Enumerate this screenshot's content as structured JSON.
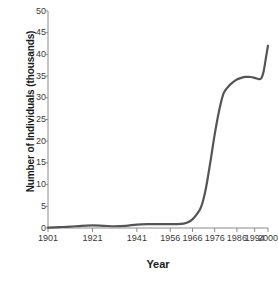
{
  "chart_data": {
    "type": "line",
    "title": "",
    "xlabel": "Year",
    "ylabel": "Number of Individuals (thousands)",
    "xlim": [
      1901,
      2000
    ],
    "ylim": [
      0,
      50
    ],
    "grid": false,
    "legend": null,
    "line_color": "#555555",
    "xticks": [
      "1901",
      "1921",
      "1941",
      "1956",
      "1966",
      "1976",
      "1986",
      "1994",
      "2000"
    ],
    "xtick_values": [
      1901,
      1921,
      1941,
      1956,
      1966,
      1976,
      1986,
      1994,
      2000
    ],
    "yticks": [
      "0",
      "5",
      "10",
      "15",
      "20",
      "25",
      "30",
      "35",
      "40",
      "45",
      "50"
    ],
    "ytick_values": [
      0,
      5,
      10,
      15,
      20,
      25,
      30,
      35,
      40,
      45,
      50
    ],
    "series": [
      {
        "name": "Number of Individuals",
        "x": [
          1901,
          1906,
          1911,
          1916,
          1921,
          1926,
          1931,
          1936,
          1941,
          1946,
          1951,
          1956,
          1959,
          1962,
          1964,
          1966,
          1968,
          1970,
          1972,
          1974,
          1976,
          1978,
          1980,
          1982,
          1984,
          1986,
          1988,
          1990,
          1992,
          1994,
          1996,
          1997,
          1998,
          1999,
          2000
        ],
        "y": [
          0.1,
          0.2,
          0.3,
          0.5,
          0.6,
          0.5,
          0.4,
          0.5,
          0.8,
          0.9,
          0.9,
          0.9,
          0.9,
          1.0,
          1.3,
          2.0,
          3.2,
          5.0,
          9.0,
          15.0,
          21.5,
          27.0,
          31.0,
          32.5,
          33.5,
          34.2,
          34.6,
          34.8,
          34.8,
          34.6,
          34.3,
          34.5,
          36.0,
          39.0,
          42.0
        ]
      }
    ]
  },
  "axis": {
    "x_title": "Year",
    "y_title": "Number of Individuals (thousands)"
  }
}
